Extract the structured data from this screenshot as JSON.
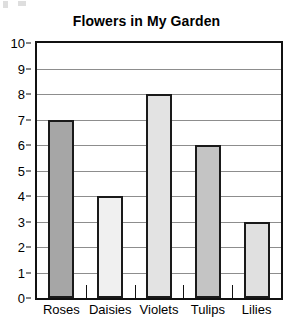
{
  "chart_data": {
    "type": "bar",
    "title": "Flowers in My Garden",
    "xlabel": "",
    "ylabel": "",
    "categories": [
      "Roses",
      "Daisies",
      "Violets",
      "Tulips",
      "Lilies"
    ],
    "values": [
      7,
      4,
      8,
      6,
      3
    ],
    "bar_colors": [
      "#a6a6a6",
      "#f0f0f0",
      "#e3e3e3",
      "#c4c4c4",
      "#e0e0e0"
    ],
    "bar_edge_color": "#1a1a1a",
    "ylim": [
      0,
      10
    ],
    "ytick_labels": [
      "0",
      "1",
      "2",
      "3",
      "4",
      "5",
      "6",
      "7",
      "8",
      "9",
      "10"
    ],
    "ytick_values": [
      0,
      1,
      2,
      3,
      4,
      5,
      6,
      7,
      8,
      9,
      10
    ],
    "grid": "horizontal",
    "gridline_color": "#8d8d8d",
    "legend": "none",
    "frame_color": "#111111",
    "background_color": "#ffffff"
  }
}
